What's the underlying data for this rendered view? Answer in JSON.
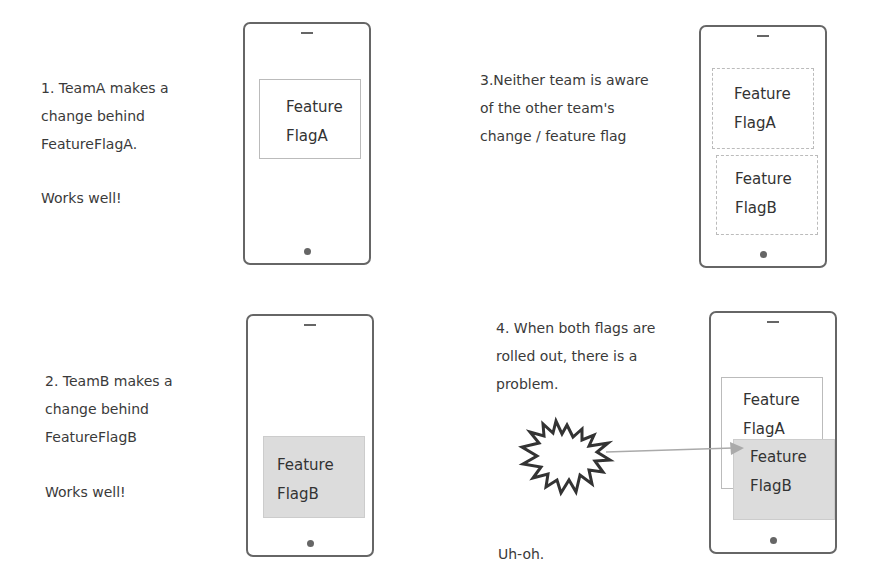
{
  "panels": [
    {
      "step": "1",
      "lines": [
        "1. TeamA makes a",
        "change behind",
        "FeatureFlagA."
      ],
      "result": "Works well!",
      "flags": [
        {
          "line1": "Feature",
          "line2": "FlagA",
          "style": "solid"
        }
      ]
    },
    {
      "step": "2",
      "lines": [
        "2. TeamB makes a",
        "change behind",
        "FeatureFlagB"
      ],
      "result": "Works well!",
      "flags": [
        {
          "line1": "Feature",
          "line2": "FlagB",
          "style": "shaded"
        }
      ]
    },
    {
      "step": "3",
      "lines": [
        "3.Neither team is aware",
        "of the other team's",
        "change / feature flag"
      ],
      "flags": [
        {
          "line1": "Feature",
          "line2": "FlagA",
          "style": "dashed"
        },
        {
          "line1": "Feature",
          "line2": "FlagB",
          "style": "dashed"
        }
      ]
    },
    {
      "step": "4",
      "lines": [
        "4. When both flags are",
        "rolled out, there is a",
        "problem."
      ],
      "result": "Uh-oh.",
      "flags": [
        {
          "line1": "Feature",
          "line2": "FlagA",
          "style": "solid"
        },
        {
          "line1": "Feature",
          "line2": "FlagB",
          "style": "shaded"
        }
      ],
      "annotation": "explosion-icon"
    }
  ],
  "colors": {
    "outline": "#666666",
    "box_border": "#bbbbbb",
    "shaded_fill": "#dcdcdc",
    "arrow": "#aaaaaa"
  }
}
